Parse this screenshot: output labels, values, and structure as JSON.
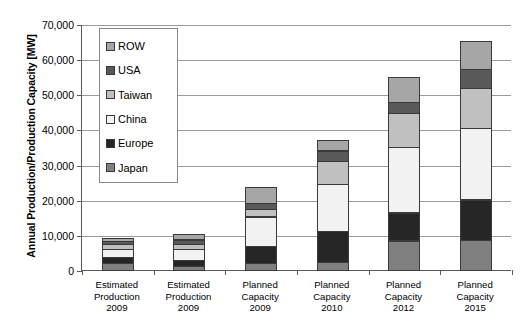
{
  "chart_data": {
    "type": "bar",
    "subtype": "stacked-column",
    "title": "",
    "xlabel": "",
    "ylabel": "Annual Production/Production Capacity [MW]",
    "ylim": [
      0,
      70000
    ],
    "ytick_step": 10000,
    "ytick_labels": [
      "70,000",
      "60,000",
      "50,000",
      "40,000",
      "30,000",
      "20,000",
      "10,000",
      "0"
    ],
    "ytick_values": [
      70000,
      60000,
      50000,
      40000,
      30000,
      20000,
      10000,
      0
    ],
    "grid": true,
    "legend_position": "inside-top-left",
    "categories": [
      "Estimated Production 2009",
      "Estimated Production 2009",
      "Planned Capacity 2009",
      "Planned Capacity 2010",
      "Planned Capacity 2012",
      "Planned Capacity 2015"
    ],
    "category_lines": [
      [
        "Estimated",
        "Production",
        "2009"
      ],
      [
        "Estimated",
        "Production",
        "2009"
      ],
      [
        "Planned",
        "Capacity",
        "2009"
      ],
      [
        "Planned",
        "Capacity",
        "2010"
      ],
      [
        "Planned",
        "Capacity",
        "2012"
      ],
      [
        "Planned",
        "Capacity",
        "2015"
      ]
    ],
    "stack_order_bottom_to_top": [
      "Japan",
      "Europe",
      "China",
      "Taiwan",
      "USA",
      "ROW"
    ],
    "series": [
      {
        "name": "Japan",
        "color": "#808080",
        "values": [
          2100,
          1400,
          2300,
          2400,
          8600,
          8700
        ]
      },
      {
        "name": "Europe",
        "color": "#262626",
        "values": [
          2000,
          1900,
          4900,
          9200,
          8200,
          11800
        ]
      },
      {
        "name": "China",
        "color": "#f2f2f2",
        "values": [
          2500,
          3400,
          8700,
          13600,
          18800,
          20600
        ]
      },
      {
        "name": "Taiwan",
        "color": "#c0c0c0",
        "values": [
          1600,
          1700,
          2300,
          6600,
          10000,
          11500
        ]
      },
      {
        "name": "USA",
        "color": "#595959",
        "values": [
          1200,
          1400,
          2000,
          3300,
          3300,
          5800
        ]
      },
      {
        "name": "ROW",
        "color": "#a6a6a6",
        "values": [
          1200,
          1900,
          4700,
          3400,
          7500,
          8200
        ]
      }
    ],
    "totals": [
      10600,
      11700,
      24900,
      38500,
      56400,
      66600
    ]
  },
  "legend": {
    "items": [
      {
        "label": "ROW",
        "color": "#a6a6a6"
      },
      {
        "label": "USA",
        "color": "#595959"
      },
      {
        "label": "Taiwan",
        "color": "#c0c0c0"
      },
      {
        "label": "China",
        "color": "#f2f2f2"
      },
      {
        "label": "Europe",
        "color": "#262626"
      },
      {
        "label": "Japan",
        "color": "#808080"
      }
    ]
  },
  "colors": {
    "axis": "#5a5a5a",
    "gridline": "#9a9a9a",
    "bar_outline": "#3a3a3a",
    "background": "#ffffff",
    "text": "#000000"
  }
}
